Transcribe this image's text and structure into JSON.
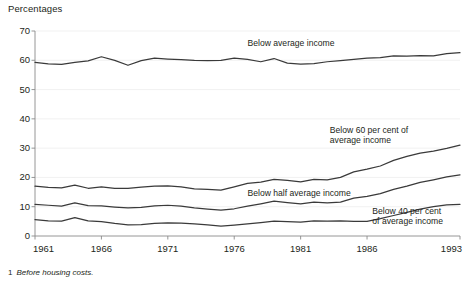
{
  "chart_title": "Percentages",
  "footnote": {
    "marker": "1",
    "text": "Before housing costs."
  },
  "chart_data": {
    "type": "line",
    "title": "Percentages",
    "xlabel": "",
    "ylabel": "Percentages",
    "xlim": [
      1961,
      1993
    ],
    "ylim": [
      0,
      70
    ],
    "grid": true,
    "legend_position": "inline-annotations",
    "ytick_labels": [
      "0",
      "10",
      "20",
      "30",
      "40",
      "50",
      "60",
      "70"
    ],
    "ytick_values": [
      0,
      10,
      20,
      30,
      40,
      50,
      60,
      70
    ],
    "xtick_labels": [
      "1961",
      "1966",
      "1971",
      "1976",
      "1981",
      "1986",
      "1993"
    ],
    "xtick_values": [
      1961,
      1966,
      1971,
      1976,
      1981,
      1986,
      1993
    ],
    "x": [
      1961,
      1962,
      1963,
      1964,
      1965,
      1966,
      1967,
      1968,
      1969,
      1970,
      1971,
      1972,
      1973,
      1974,
      1975,
      1976,
      1977,
      1978,
      1979,
      1980,
      1981,
      1982,
      1983,
      1984,
      1985,
      1986,
      1987,
      1988,
      1989,
      1990,
      1991,
      1992,
      1993
    ],
    "series": [
      {
        "name": "Below average income",
        "label": "Below average income",
        "label_x": 1977.0,
        "label_y": 65.5,
        "color": "#3a3a3a",
        "values": [
          59.3,
          58.8,
          58.6,
          59.3,
          59.8,
          61.2,
          60.0,
          58.3,
          59.9,
          60.7,
          60.4,
          60.2,
          60.0,
          59.9,
          60.0,
          60.7,
          60.3,
          59.5,
          60.6,
          59.0,
          58.7,
          58.9,
          59.5,
          59.9,
          60.3,
          60.7,
          60.9,
          61.5,
          61.4,
          61.6,
          61.5,
          62.3,
          62.6
        ]
      },
      {
        "name": "Below 60 per cent of average income",
        "label": "Below 60 per cent of\naverage income",
        "label_x": 1983.2,
        "label_y": 36.0,
        "color": "#3a3a3a",
        "values": [
          17.0,
          16.6,
          16.4,
          17.4,
          16.3,
          16.8,
          16.3,
          16.3,
          16.7,
          17.0,
          17.1,
          16.8,
          16.1,
          15.9,
          15.7,
          16.8,
          18.0,
          18.4,
          19.3,
          19.0,
          18.5,
          19.3,
          19.2,
          20.0,
          21.9,
          22.8,
          23.9,
          25.8,
          27.2,
          28.3,
          29.0,
          29.9,
          31.0
        ]
      },
      {
        "name": "Below half average income",
        "label": "Below half average income",
        "label_x": 1977.0,
        "label_y": 14.5,
        "color": "#3a3a3a",
        "values": [
          10.8,
          10.5,
          10.2,
          11.3,
          10.4,
          10.3,
          9.9,
          9.6,
          9.8,
          10.3,
          10.5,
          10.2,
          9.6,
          9.2,
          8.8,
          9.3,
          10.2,
          11.0,
          11.9,
          11.4,
          11.0,
          11.6,
          11.3,
          11.6,
          12.9,
          13.5,
          14.5,
          15.9,
          17.0,
          18.3,
          19.2,
          20.2,
          20.9
        ]
      },
      {
        "name": "Below 40 per cent of average income",
        "label": "Below 40 per cent\nof average income",
        "label_x": 1986.4,
        "label_y": 8.3,
        "color": "#3a3a3a",
        "values": [
          5.6,
          5.2,
          5.1,
          6.3,
          5.2,
          4.9,
          4.3,
          3.8,
          3.9,
          4.3,
          4.5,
          4.4,
          4.1,
          3.8,
          3.4,
          3.7,
          4.1,
          4.6,
          5.1,
          4.9,
          4.7,
          5.2,
          5.1,
          5.2,
          5.0,
          5.0,
          5.9,
          7.0,
          8.1,
          9.2,
          10.0,
          10.6,
          10.8
        ]
      }
    ]
  }
}
